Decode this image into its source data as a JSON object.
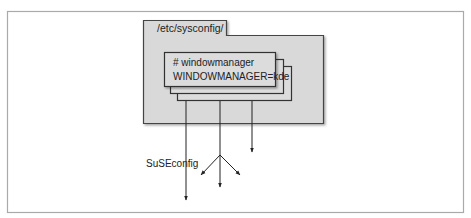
{
  "diagram": {
    "folder": {
      "label": "/etc/sysconfig/",
      "fill": "#d9d9d9",
      "stroke": "#444444"
    },
    "config_file": {
      "line1": "# windowmanager",
      "line2": "WINDOWMANAGER=kde",
      "stack_count": 3,
      "fill": "#dcdcdc"
    },
    "process_label": "SuSEconfig",
    "arrows": [
      {
        "name": "suseconfig-output",
        "from": [
          186,
          101
        ],
        "to": [
          186,
          200
        ]
      },
      {
        "name": "branch-left",
        "from": [
          220,
          155
        ],
        "to": [
          201,
          175
        ]
      },
      {
        "name": "branch-center",
        "from": [
          220,
          101
        ],
        "to": [
          220,
          187
        ]
      },
      {
        "name": "branch-right",
        "from": [
          220,
          155
        ],
        "to": [
          240,
          175
        ]
      },
      {
        "name": "direct-output",
        "from": [
          252,
          101
        ],
        "to": [
          252,
          152
        ]
      }
    ],
    "frame_stroke": "#aaaaaa"
  }
}
